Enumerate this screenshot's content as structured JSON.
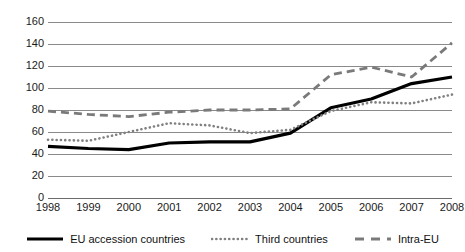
{
  "chart_data": {
    "type": "line",
    "title": "",
    "subtitle": "",
    "xlabel": "",
    "ylabel": "",
    "categories": [
      "1998",
      "1999",
      "2000",
      "2001",
      "2002",
      "2003",
      "2004",
      "2005",
      "2006",
      "2007",
      "2008"
    ],
    "x": [
      1998,
      1999,
      2000,
      2001,
      2002,
      2003,
      2004,
      2005,
      2006,
      2007,
      2008
    ],
    "ylim": [
      0,
      160
    ],
    "yticks": [
      0,
      20,
      40,
      60,
      80,
      100,
      120,
      140,
      160
    ],
    "grid": true,
    "legend_position": "bottom",
    "series": [
      {
        "name": "EU accession countries",
        "style": "solid",
        "color": "#000000",
        "values": [
          47,
          45,
          44,
          50,
          51,
          51,
          59,
          82,
          90,
          104,
          110
        ]
      },
      {
        "name": "Third countries",
        "style": "dotted",
        "color": "#808080",
        "values": [
          53,
          52,
          60,
          68,
          66,
          59,
          62,
          79,
          87,
          86,
          94
        ]
      },
      {
        "name": "Intra-EU",
        "style": "dashed",
        "color": "#7a7a7a",
        "values": [
          79,
          76,
          74,
          78,
          80,
          80,
          81,
          112,
          119,
          110,
          141
        ]
      }
    ]
  },
  "legend": {
    "items": [
      {
        "label": "EU accession countries",
        "icon": "solid-line-swatch"
      },
      {
        "label": "Third countries",
        "icon": "dotted-line-swatch"
      },
      {
        "label": "Intra-EU",
        "icon": "dashed-line-swatch"
      }
    ]
  },
  "colors": {
    "gridline": "#8a8a8a",
    "axis": "#6b6b6b",
    "text": "#1a1a1a",
    "background": "#ffffff"
  }
}
